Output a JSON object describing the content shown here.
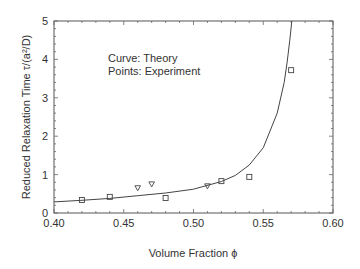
{
  "chart_data": {
    "type": "scatter",
    "title": "",
    "xlabel": "Volume Fraction ϕ",
    "ylabel": "Reduced Relaxation Time  τ/(a²/D)",
    "xlim": [
      0.4,
      0.6
    ],
    "ylim": [
      0,
      5
    ],
    "x_ticks": [
      "0.40",
      "0.45",
      "0.50",
      "0.55",
      "0.60"
    ],
    "y_ticks": [
      "0",
      "1",
      "2",
      "3",
      "4",
      "5"
    ],
    "grid": false,
    "annotations": [
      "Curve:  Theory",
      "Points: Experiment"
    ],
    "series": [
      {
        "name": "Theory",
        "kind": "line",
        "x": [
          0.4,
          0.42,
          0.44,
          0.46,
          0.48,
          0.5,
          0.52,
          0.53,
          0.54,
          0.55,
          0.56,
          0.565,
          0.567,
          0.569,
          0.5705
        ],
        "y": [
          0.29,
          0.33,
          0.38,
          0.45,
          0.52,
          0.62,
          0.82,
          0.98,
          1.25,
          1.7,
          2.6,
          3.4,
          3.9,
          4.5,
          5.0
        ]
      },
      {
        "name": "Experiment (squares)",
        "kind": "scatter",
        "marker": "square",
        "x": [
          0.42,
          0.44,
          0.48,
          0.52,
          0.54,
          0.57
        ],
        "y": [
          0.34,
          0.42,
          0.39,
          0.83,
          0.94,
          3.72
        ]
      },
      {
        "name": "Experiment (triangles)",
        "kind": "scatter",
        "marker": "triangle-down",
        "x": [
          0.46,
          0.47,
          0.51
        ],
        "y": [
          0.65,
          0.75,
          0.7
        ]
      }
    ]
  },
  "labels": {
    "xlabel": "Volume Fraction  ϕ",
    "ylabel": "Reduced Relaxation Time  τ/(a²/D)",
    "note_curve": "Curve:  Theory",
    "note_points": "Points: Experiment"
  }
}
